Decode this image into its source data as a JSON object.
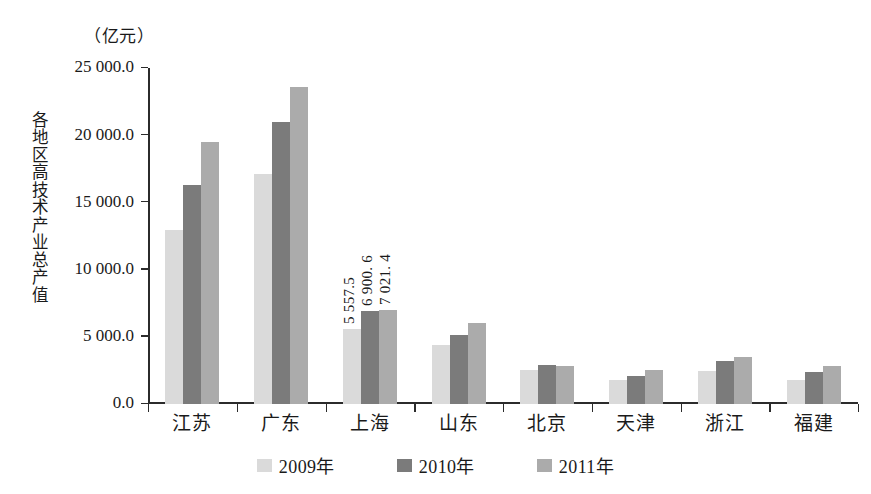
{
  "chart_data": {
    "type": "bar",
    "title": "",
    "unit_caption": "（亿元）",
    "ylabel": "各地区高技术产业总产值",
    "xlabel": "",
    "ylim": [
      0,
      25000
    ],
    "ytick_labels": [
      "25 000.0",
      "20 000.0",
      "15 000.0",
      "10 000.0",
      "5 000.0",
      "0.0"
    ],
    "ytick_values": [
      25000,
      20000,
      15000,
      10000,
      5000,
      0
    ],
    "grid": false,
    "legend_position": "bottom-center",
    "categories": [
      "江苏",
      "广东",
      "上海",
      "山东",
      "北京",
      "天津",
      "浙江",
      "福建"
    ],
    "series": [
      {
        "name": "2009年",
        "color": "#dadada",
        "values": [
          12980,
          17100,
          5557.5,
          4400,
          2550,
          1800,
          2450,
          1750
        ]
      },
      {
        "name": "2010年",
        "color": "#7b7b7b",
        "values": [
          16300,
          21000,
          6900.6,
          5100,
          2870,
          2080,
          3200,
          2380
        ]
      },
      {
        "name": "2011年",
        "color": "#ababab",
        "values": [
          19500,
          23600,
          7021.4,
          6050,
          2800,
          2520,
          3500,
          2800
        ]
      }
    ],
    "annotations": [
      {
        "category": "上海",
        "series": "2009年",
        "text": "5 557.5"
      },
      {
        "category": "上海",
        "series": "2010年",
        "text": "6 900. 6"
      },
      {
        "category": "上海",
        "series": "2011年",
        "text": "7 021. 4"
      }
    ]
  }
}
